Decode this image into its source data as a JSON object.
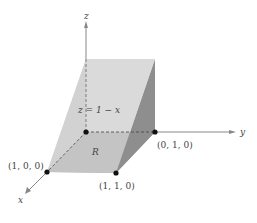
{
  "diagram": {
    "axes": {
      "x_label": "x",
      "y_label": "y",
      "z_label": "z"
    },
    "surface_label": "z = 1 − x",
    "region_label": "R",
    "points": [
      {
        "name": "origin",
        "label": ""
      },
      {
        "name": "point-010",
        "label": "(0, 1, 0)"
      },
      {
        "name": "point-100",
        "label": "(1, 0, 0)"
      },
      {
        "name": "point-110",
        "label": "(1, 1, 0)"
      }
    ],
    "colors": {
      "top_face": "#c9c9c9",
      "side_face": "#8f8f8f",
      "base_region": "#9a9a9a",
      "left_face": "#d8d8d8",
      "axis": "#777777",
      "point": "#111111"
    }
  }
}
